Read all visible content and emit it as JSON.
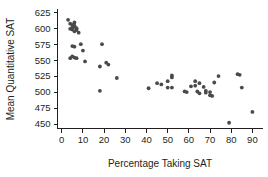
{
  "chart_data": {
    "type": "scatter",
    "title": "",
    "xlabel": "Percentage Taking SAT",
    "ylabel": "Mean Quantitative  SAT",
    "xlim": [
      -2,
      95
    ],
    "ylim": [
      443,
      630
    ],
    "xticks": [
      0,
      10,
      20,
      30,
      40,
      50,
      60,
      70,
      80,
      90
    ],
    "yticks": [
      450,
      475,
      500,
      525,
      550,
      575,
      600,
      625
    ],
    "grid": false,
    "legend": null,
    "marker_color": "#4a4a4a",
    "axis_color": "#231f20",
    "points": [
      {
        "x": 3,
        "y": 613
      },
      {
        "x": 4,
        "y": 607
      },
      {
        "x": 5,
        "y": 605
      },
      {
        "x": 5,
        "y": 601
      },
      {
        "x": 6,
        "y": 609
      },
      {
        "x": 6,
        "y": 602
      },
      {
        "x": 5,
        "y": 598
      },
      {
        "x": 4,
        "y": 599
      },
      {
        "x": 6,
        "y": 604
      },
      {
        "x": 7,
        "y": 600
      },
      {
        "x": 7,
        "y": 597
      },
      {
        "x": 6,
        "y": 595
      },
      {
        "x": 8,
        "y": 593
      },
      {
        "x": 5,
        "y": 572
      },
      {
        "x": 6,
        "y": 571
      },
      {
        "x": 9,
        "y": 575
      },
      {
        "x": 10,
        "y": 565
      },
      {
        "x": 5,
        "y": 556
      },
      {
        "x": 4,
        "y": 553
      },
      {
        "x": 6,
        "y": 554
      },
      {
        "x": 7,
        "y": 553
      },
      {
        "x": 11,
        "y": 548
      },
      {
        "x": 18,
        "y": 540
      },
      {
        "x": 19,
        "y": 575
      },
      {
        "x": 21,
        "y": 546
      },
      {
        "x": 22,
        "y": 543
      },
      {
        "x": 18,
        "y": 502
      },
      {
        "x": 26,
        "y": 522
      },
      {
        "x": 41,
        "y": 506
      },
      {
        "x": 45,
        "y": 514
      },
      {
        "x": 47,
        "y": 512
      },
      {
        "x": 50,
        "y": 517
      },
      {
        "x": 50,
        "y": 507
      },
      {
        "x": 52,
        "y": 526
      },
      {
        "x": 52,
        "y": 523
      },
      {
        "x": 52,
        "y": 507
      },
      {
        "x": 58,
        "y": 501
      },
      {
        "x": 59,
        "y": 500
      },
      {
        "x": 61,
        "y": 509
      },
      {
        "x": 63,
        "y": 517
      },
      {
        "x": 63,
        "y": 510
      },
      {
        "x": 64,
        "y": 501
      },
      {
        "x": 65,
        "y": 514
      },
      {
        "x": 65,
        "y": 498
      },
      {
        "x": 67,
        "y": 508
      },
      {
        "x": 68,
        "y": 502
      },
      {
        "x": 68,
        "y": 499
      },
      {
        "x": 70,
        "y": 500
      },
      {
        "x": 70,
        "y": 495
      },
      {
        "x": 71,
        "y": 494
      },
      {
        "x": 72,
        "y": 515
      },
      {
        "x": 74,
        "y": 525
      },
      {
        "x": 79,
        "y": 452
      },
      {
        "x": 83,
        "y": 528
      },
      {
        "x": 84,
        "y": 527
      },
      {
        "x": 85,
        "y": 507
      },
      {
        "x": 90,
        "y": 469
      }
    ]
  }
}
